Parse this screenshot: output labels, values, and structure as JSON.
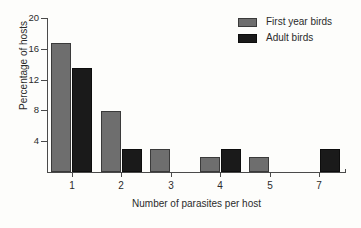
{
  "chart_data": {
    "type": "bar",
    "title": "",
    "xlabel": "Number of parasites per host",
    "ylabel": "Percentage of hosts",
    "categories": [
      "1",
      "2",
      "3",
      "4",
      "5",
      "7"
    ],
    "series": [
      {
        "name": "First year birds",
        "color": "#6e6e6e",
        "values": [
          16.7,
          7.9,
          3.0,
          2.0,
          2.0,
          0
        ]
      },
      {
        "name": "Adult birds",
        "color": "#1a1a1a",
        "values": [
          13.5,
          3.0,
          0,
          3.0,
          0,
          3.0
        ]
      }
    ],
    "ylim": [
      0,
      20
    ],
    "yticks": [
      4,
      8,
      12,
      16,
      20
    ],
    "grid": false,
    "legend_position": "top-right"
  }
}
